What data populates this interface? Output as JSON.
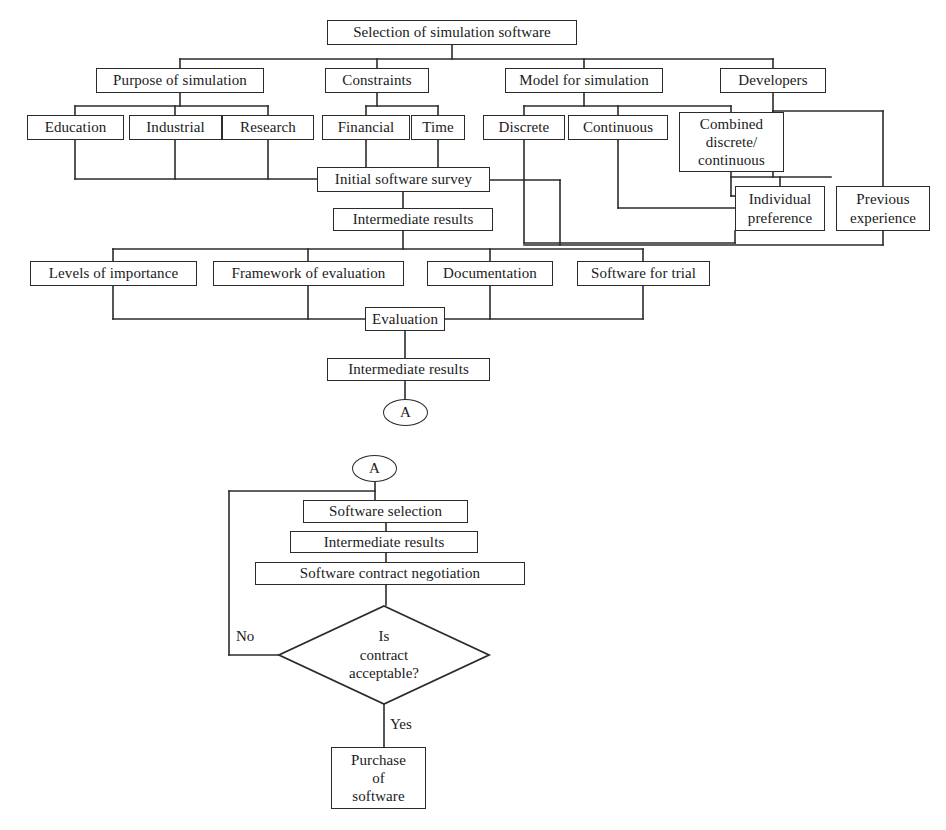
{
  "diagram": {
    "title": "Selection of simulation software",
    "type": "flowchart",
    "page_size": {
      "width": 946,
      "height": 830
    }
  },
  "nodes": {
    "root": {
      "label": "Selection of simulation software",
      "shape": "rect",
      "x": 327,
      "y": 20,
      "w": 250,
      "h": 25
    },
    "purpose": {
      "label": "Purpose of simulation",
      "shape": "rect",
      "x": 96,
      "y": 68,
      "w": 168,
      "h": 25
    },
    "constraints": {
      "label": "Constraints",
      "shape": "rect",
      "x": 325,
      "y": 68,
      "w": 104,
      "h": 25
    },
    "model": {
      "label": "Model for simulation",
      "shape": "rect",
      "x": 505,
      "y": 68,
      "w": 158,
      "h": 25
    },
    "developers": {
      "label": "Developers",
      "shape": "rect",
      "x": 720,
      "y": 68,
      "w": 106,
      "h": 25
    },
    "education": {
      "label": "Education",
      "shape": "rect",
      "x": 27,
      "y": 115,
      "w": 97,
      "h": 25
    },
    "industrial": {
      "label": "Industrial",
      "shape": "rect",
      "x": 129,
      "y": 115,
      "w": 93,
      "h": 25
    },
    "research": {
      "label": "Research",
      "shape": "rect",
      "x": 222,
      "y": 115,
      "w": 92,
      "h": 25
    },
    "financial": {
      "label": "Financial",
      "shape": "rect",
      "x": 322,
      "y": 115,
      "w": 88,
      "h": 25
    },
    "time": {
      "label": "Time",
      "shape": "rect",
      "x": 411,
      "y": 115,
      "w": 54,
      "h": 25
    },
    "discrete": {
      "label": "Discrete",
      "shape": "rect",
      "x": 483,
      "y": 115,
      "w": 82,
      "h": 25
    },
    "continuous": {
      "label": "Continuous",
      "shape": "rect",
      "x": 568,
      "y": 115,
      "w": 100,
      "h": 25
    },
    "combined": {
      "label": "Combined discrete/ continuous",
      "lines": [
        "Combined",
        "discrete/",
        "continuous"
      ],
      "shape": "rect",
      "x": 679,
      "y": 112,
      "w": 105,
      "h": 60
    },
    "individual": {
      "label": "Individual preference",
      "lines": [
        "Individual",
        "preference"
      ],
      "shape": "rect",
      "x": 735,
      "y": 186,
      "w": 90,
      "h": 45
    },
    "previous": {
      "label": "Previous experience",
      "lines": [
        "Previous",
        "experience"
      ],
      "shape": "rect",
      "x": 836,
      "y": 186,
      "w": 94,
      "h": 45
    },
    "initial_survey": {
      "label": "Initial software survey",
      "shape": "rect",
      "x": 317,
      "y": 167,
      "w": 173,
      "h": 25
    },
    "inter1": {
      "label": "Intermediate results",
      "shape": "rect",
      "x": 333,
      "y": 208,
      "w": 160,
      "h": 23
    },
    "levels": {
      "label": "Levels of importance",
      "shape": "rect",
      "x": 30,
      "y": 261,
      "w": 167,
      "h": 25
    },
    "framework": {
      "label": "Framework of evaluation",
      "shape": "rect",
      "x": 213,
      "y": 261,
      "w": 191,
      "h": 25
    },
    "documentation": {
      "label": "Documentation",
      "shape": "rect",
      "x": 427,
      "y": 261,
      "w": 126,
      "h": 25
    },
    "trial": {
      "label": "Software for trial",
      "shape": "rect",
      "x": 577,
      "y": 261,
      "w": 133,
      "h": 25
    },
    "evaluation": {
      "label": "Evaluation",
      "shape": "rect",
      "x": 365,
      "y": 307,
      "w": 80,
      "h": 24
    },
    "inter2": {
      "label": "Intermediate results",
      "shape": "rect",
      "x": 327,
      "y": 358,
      "w": 163,
      "h": 23
    },
    "conn_a_top": {
      "label": "A",
      "shape": "ellipse",
      "x": 383,
      "y": 399,
      "w": 45,
      "h": 27
    },
    "conn_a_bottom": {
      "label": "A",
      "shape": "ellipse",
      "x": 352,
      "y": 455,
      "w": 45,
      "h": 27
    },
    "sw_selection": {
      "label": "Software selection",
      "shape": "rect",
      "x": 303,
      "y": 500,
      "w": 165,
      "h": 23
    },
    "inter3": {
      "label": "Intermediate results",
      "shape": "rect",
      "x": 290,
      "y": 531,
      "w": 188,
      "h": 22
    },
    "negotiation": {
      "label": "Software contract negotiation",
      "shape": "rect",
      "x": 255,
      "y": 562,
      "w": 270,
      "h": 23
    },
    "decision": {
      "label": "Is contract acceptable?",
      "lines": [
        "Is",
        "contract",
        "acceptable?"
      ],
      "shape": "diamond",
      "x": 278,
      "y": 605,
      "w": 212,
      "h": 100
    },
    "purchase": {
      "label": "Purchase of software",
      "lines": [
        "Purchase",
        "of",
        "software"
      ],
      "shape": "rect",
      "x": 331,
      "y": 747,
      "w": 95,
      "h": 62
    }
  },
  "edge_labels": {
    "no": {
      "text": "No",
      "x": 236,
      "y": 628
    },
    "yes": {
      "text": "Yes",
      "x": 390,
      "y": 716
    }
  },
  "colors": {
    "stroke": "#2b2b2b",
    "background": "#ffffff",
    "text": "#1a1a1a"
  }
}
